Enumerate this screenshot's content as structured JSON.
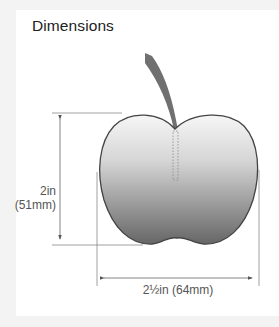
{
  "title": "Dimensions",
  "dimensions": {
    "height": {
      "imperial": "2in",
      "metric": "(51mm)"
    },
    "width": {
      "label": "2½in (64mm)"
    }
  },
  "colors": {
    "background": "#f3f3f3",
    "card": "#ffffff",
    "apple_top": "#f4f4f4",
    "apple_bottom": "#6e6e6e",
    "stem": "#707070",
    "outline": "#444444",
    "dimension_line": "#888888"
  },
  "icons": {
    "apple": "apple-silhouette",
    "arrow": "dimension-arrow"
  }
}
